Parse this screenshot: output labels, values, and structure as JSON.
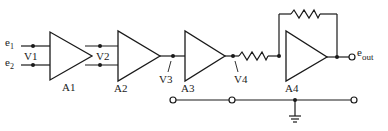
{
  "diagram": {
    "type": "amplifier-chain-schematic",
    "inputs": [
      {
        "name": "e",
        "subscript": "1"
      },
      {
        "name": "e",
        "subscript": "2"
      }
    ],
    "voltage_labels": [
      "V1",
      "V2",
      "V3",
      "V4"
    ],
    "amplifiers": [
      "A1",
      "A2",
      "A3",
      "A4"
    ],
    "output": {
      "name": "e",
      "subscript": "out"
    },
    "components": {
      "input_resistor": "resistor before A4",
      "feedback_resistor": "resistor across A4",
      "ground": "ground symbol on common bottom line"
    },
    "colors": {
      "line": "#1a1a1a",
      "background": "#ffffff"
    }
  }
}
